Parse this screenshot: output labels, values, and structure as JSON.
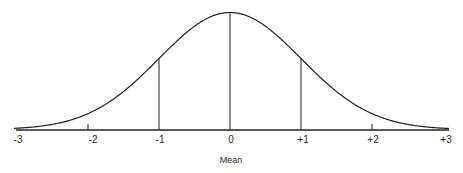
{
  "chart_data": {
    "type": "line",
    "title": "",
    "xlabel": "Mean",
    "ylabel": "",
    "x_ticks": [
      "-3",
      "-2",
      "-1",
      "0",
      "+1",
      "+2",
      "+3"
    ],
    "x": [
      -3,
      -2,
      -1,
      0,
      1,
      2,
      3
    ],
    "series": [
      {
        "name": "Normal distribution curve",
        "values": [
          0.0044,
          0.054,
          0.242,
          0.399,
          0.242,
          0.054,
          0.0044
        ]
      }
    ],
    "vertical_lines_at": [
      -1,
      0,
      1
    ],
    "xlim": [
      -3,
      3
    ],
    "grid": false,
    "legend": "none"
  },
  "labels": {
    "ticks": [
      "-3",
      "-2",
      "-1",
      "0",
      "+1",
      "+2",
      "+3"
    ],
    "axis_title": "Mean"
  }
}
